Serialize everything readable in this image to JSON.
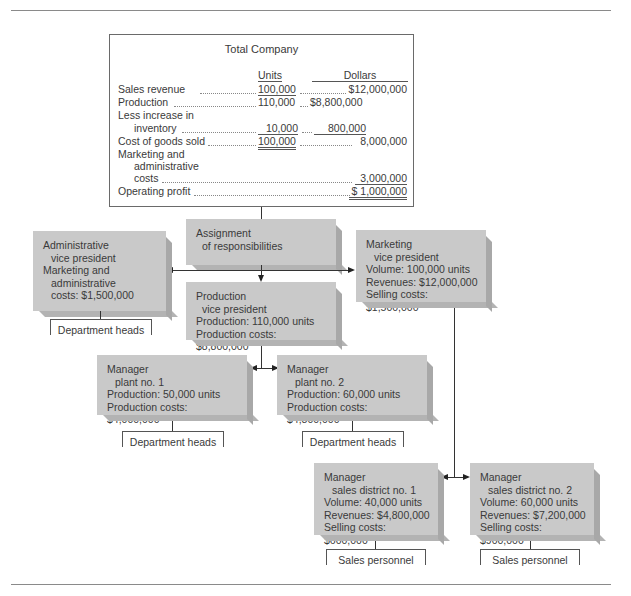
{
  "total_company": {
    "title": "Total Company",
    "col_units": "Units",
    "col_dollars": "Dollars",
    "rows": [
      {
        "label": "Sales revenue",
        "units": "100,000",
        "dollars_left": "",
        "dollars_right": "$12,000,000"
      },
      {
        "label": "Production",
        "units": "110,000",
        "dollars_left": "$8,800,000",
        "dollars_right": ""
      },
      {
        "label": "Less increase in",
        "label2": "inventory",
        "units": "10,000",
        "dollars_left": "800,000",
        "dollars_right": ""
      },
      {
        "label": "Cost of goods sold",
        "units": "100,000",
        "dollars_left": "",
        "dollars_right": "8,000,000"
      },
      {
        "label": "Marketing and",
        "label2": "administrative",
        "label3": "costs",
        "units": "",
        "dollars_left": "",
        "dollars_right": "3,000,000"
      },
      {
        "label": "Operating profit",
        "units": "",
        "dollars_left": "",
        "dollars_right": "$ 1,000,000"
      }
    ]
  },
  "assignment": {
    "line1": "Assignment",
    "line2": "of responsibilities"
  },
  "admin_vp": {
    "line1": "Administrative",
    "line2": "vice president",
    "line3": "Marketing and",
    "line4": "administrative",
    "line5": "costs: $1,500,000",
    "sub": "Department heads"
  },
  "production_vp": {
    "line1": "Production",
    "line2": "vice president",
    "line3": "Production: 110,000 units",
    "line4": "Production costs: $8,800,000"
  },
  "marketing_vp": {
    "line1": "Marketing",
    "line2": "vice president",
    "line3": "Volume: 100,000 units",
    "line4": "Revenues: $12,000,000",
    "line5": "Selling costs: $1,500,000"
  },
  "plant1": {
    "line1": "Manager",
    "line2": "plant no. 1",
    "line3": "Production: 50,000 units",
    "line4": "Production costs: $4,000,000",
    "sub": "Department heads"
  },
  "plant2": {
    "line1": "Manager",
    "line2": "plant no. 2",
    "line3": "Production: 60,000 units",
    "line4": "Production costs: $4,800,000",
    "sub": "Department heads"
  },
  "district1": {
    "line1": "Manager",
    "line2": "sales district no. 1",
    "line3": "Volume: 40,000 units",
    "line4": "Revenues: $4,800,000",
    "line5": "Selling costs: $600,000",
    "sub": "Sales personnel"
  },
  "district2": {
    "line1": "Manager",
    "line2": "sales district no. 2",
    "line3": "Volume: 60,000 units",
    "line4": "Revenues: $7,200,000",
    "line5": "Selling costs: $900,000",
    "sub": "Sales personnel"
  }
}
